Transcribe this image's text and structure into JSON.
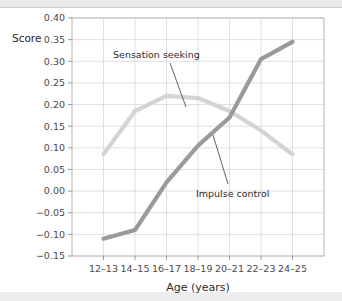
{
  "figure": {
    "accent_dark": "#9a9a9a",
    "accent_light": "#d4d4d4",
    "grid_color": "#d8d8d8",
    "frame_color": "#b5b5b5"
  },
  "labels": {
    "score_title": "Score",
    "xlabel": "Age (years)",
    "annotation_sensation": "Sensation seeking",
    "annotation_impulse": "Impulse control"
  },
  "chart_data": {
    "type": "line",
    "title": "",
    "subtitle": "",
    "xlabel": "Age (years)",
    "ylabel": "Score",
    "ylim": [
      -0.15,
      0.4
    ],
    "xlim": [
      0,
      6
    ],
    "grid": true,
    "legend_position": "inline-annotations",
    "categories": [
      "12–13",
      "14–15",
      "16–17",
      "18–19",
      "20–21",
      "22–23",
      "24–25"
    ],
    "ytick_labels": [
      "0.40",
      "0.35",
      "0.30",
      "0.25",
      "0.20",
      "0.15",
      "0.10",
      "0.05",
      "0.00",
      "−0.05",
      "−0.10",
      "−0.15"
    ],
    "ytick_values": [
      0.4,
      0.35,
      0.3,
      0.25,
      0.2,
      0.15,
      0.1,
      0.05,
      0.0,
      -0.05,
      -0.1,
      -0.15
    ],
    "series": [
      {
        "name": "Sensation seeking",
        "color": "#d4d4d4",
        "values": [
          0.085,
          0.185,
          0.22,
          0.215,
          0.185,
          0.14,
          0.085
        ]
      },
      {
        "name": "Impulse control",
        "color": "#9a9a9a",
        "values": [
          -0.11,
          -0.09,
          0.02,
          0.105,
          0.17,
          0.305,
          0.345
        ]
      }
    ],
    "annotations": [
      {
        "text": "Sensation seeking",
        "series": "Sensation seeking",
        "points_to_category": "16–17"
      },
      {
        "text": "Impulse control",
        "series": "Impulse control",
        "points_to_category": "20–21"
      }
    ]
  }
}
